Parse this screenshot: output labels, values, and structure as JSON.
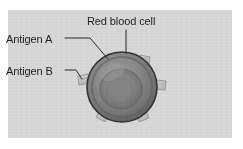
{
  "figure": {
    "kind": "biology-diagram",
    "background_color": "#d9d9d9",
    "page_color": "#ffffff",
    "labels": {
      "red_blood_cell": "Red blood cell",
      "antigen_a": "Antigen A",
      "antigen_b": "Antigen B"
    },
    "cell": {
      "name": "red-blood-cell",
      "center_x": 122,
      "center_y": 86,
      "radius": 34,
      "outline_color": "#3a3a3a",
      "rim_color": "#6f6f6f",
      "body_color": "#8e8e8e",
      "center_dimple_color": "#7a7a7a"
    },
    "antigens": {
      "fill_color": "#c2c2c2",
      "stroke_color": "#9a9a9a",
      "count": 6,
      "positions_deg": [
        250,
        292,
        335,
        20,
        70,
        160
      ]
    },
    "leader_lines": {
      "color": "#2b2b2b",
      "width": 1
    }
  }
}
